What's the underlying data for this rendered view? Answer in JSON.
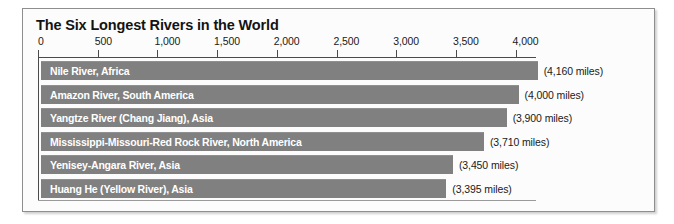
{
  "chart_data": {
    "type": "bar",
    "orientation": "horizontal",
    "title": "The Six Longest Rivers in the World",
    "xlabel": "",
    "ylabel": "",
    "unit": "miles",
    "xlim": [
      0,
      4500
    ],
    "grid": false,
    "legend": null,
    "tick_labels": [
      "0",
      "500",
      "1,000",
      "1,500",
      "2,000",
      "2,500",
      "3,000",
      "3,500",
      "4,000"
    ],
    "tick_values": [
      0,
      500,
      1000,
      1500,
      2000,
      2500,
      3000,
      3500,
      4000
    ],
    "categories": [
      "Nile River, Africa",
      "Amazon River, South America",
      "Yangtze River (Chang Jiang), Asia",
      "Mississippi-Missouri-Red Rock River, North America",
      "Yenisey-Angara River, Asia",
      "Huang He (Yellow River), Asia"
    ],
    "values": [
      4160,
      4000,
      3900,
      3710,
      3450,
      3395
    ],
    "value_labels": [
      "(4,160 miles)",
      "(4,000 miles)",
      "(3,900 miles)",
      "(3,710 miles)",
      "(3,450 miles)",
      "(3,395 miles)"
    ],
    "colors": {
      "bar": "#808080",
      "bar_text": "#ffffff",
      "axis": "#4a4a4a",
      "title_text": "#131313",
      "value_text": "#1a1a1a",
      "frame_border": "#8e8e8e",
      "background": "#fcfcfc"
    }
  }
}
